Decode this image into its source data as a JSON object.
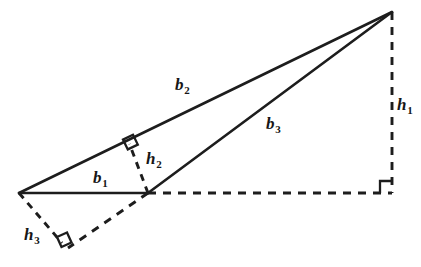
{
  "figure": {
    "background_color": "#ffffff",
    "stroke_color": "#1d1d1d",
    "width": 421,
    "height": 267
  },
  "vertices": {
    "left": {
      "name": "A",
      "x": 19,
      "y": 193
    },
    "foot_b1": {
      "name": "B",
      "x": 148,
      "y": 193
    },
    "apex": {
      "name": "C",
      "x": 392,
      "y": 12
    }
  },
  "segments": [
    {
      "id": "b1",
      "style": "solid",
      "role": "base-b1",
      "x1": 19,
      "y1": 193,
      "x2": 148,
      "y2": 193
    },
    {
      "id": "b2",
      "style": "solid",
      "role": "side-b2",
      "x1": 19,
      "y1": 193,
      "x2": 392,
      "y2": 12
    },
    {
      "id": "b3",
      "style": "solid",
      "role": "side-b3",
      "x1": 148,
      "y1": 193,
      "x2": 392,
      "y2": 12
    },
    {
      "id": "h1",
      "style": "dashed",
      "role": "altitude-h1",
      "x1": 392,
      "y1": 12,
      "x2": 392,
      "y2": 193
    },
    {
      "id": "base-extension",
      "style": "dashed",
      "role": "extended-base-b1",
      "x1": 148,
      "y1": 193,
      "x2": 392,
      "y2": 193
    },
    {
      "id": "h2",
      "style": "dashed-short",
      "role": "altitude-h2",
      "x1": 148,
      "y1": 193,
      "x2": 129.5,
      "y2": 144
    },
    {
      "id": "h3",
      "style": "dashed-short",
      "role": "altitude-h3",
      "x1": 19,
      "y1": 193,
      "x2": 62,
      "y2": 243
    },
    {
      "id": "b3-extension",
      "style": "dashed",
      "role": "extended-side-b3",
      "x1": 148,
      "y1": 193,
      "x2": 68,
      "y2": 248
    }
  ],
  "right_angles": [
    {
      "id": "ra-h1",
      "at": "bottom-right",
      "points": "380,193 380,181 392,181"
    },
    {
      "id": "ra-h2",
      "at": "foot-on-b2",
      "points": "123.0,139.6 133.0,134.8 137.8,144.6 127.8,149.4"
    },
    {
      "id": "ra-h3",
      "at": "foot-on-b3-extension",
      "points": "57.0,237.0 67.0,232.5 71.5,242.5 61.5,247.0"
    }
  ],
  "labels": [
    {
      "id": "label-b1",
      "base": "b",
      "sub": "1",
      "x": 93,
      "y": 169,
      "for": "base-b1"
    },
    {
      "id": "label-b2",
      "base": "b",
      "sub": "2",
      "x": 175,
      "y": 76,
      "for": "side-b2"
    },
    {
      "id": "label-b3",
      "base": "b",
      "sub": "3",
      "x": 266,
      "y": 115,
      "for": "side-b3"
    },
    {
      "id": "label-h1",
      "base": "h",
      "sub": "1",
      "x": 397,
      "y": 96,
      "for": "altitude-h1"
    },
    {
      "id": "label-h2",
      "base": "h",
      "sub": "2",
      "x": 146,
      "y": 150,
      "for": "altitude-h2"
    },
    {
      "id": "label-h3",
      "base": "h",
      "sub": "3",
      "x": 24,
      "y": 226,
      "for": "altitude-h3"
    }
  ]
}
